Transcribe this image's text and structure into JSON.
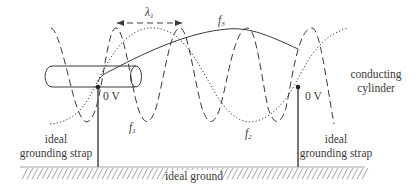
{
  "diagram": {
    "wavelength_label": "λ",
    "wavelength_sub": "1",
    "curves": [
      {
        "name": "f",
        "sub": "1",
        "style": "dashed"
      },
      {
        "name": "f",
        "sub": "2",
        "style": "dotted"
      },
      {
        "name": "f",
        "sub": "3",
        "style": "solid"
      }
    ],
    "labels": {
      "cylinder_line1": "conducting",
      "cylinder_line2": "cylinder",
      "left_voltage": "0 V",
      "right_voltage": "0 V",
      "left_strap_line1": "ideal",
      "left_strap_line2": "grounding strap",
      "right_strap_line1": "ideal",
      "right_strap_line2": "grounding strap",
      "ground": "ideal ground"
    },
    "colors": {
      "line": "#3a3a3a",
      "hatch": "#8a8a8a"
    }
  }
}
